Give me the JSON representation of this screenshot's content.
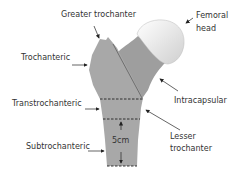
{
  "labels": {
    "greater_trochanter": "Greater  trochanter",
    "femoral_head_1": "Femoral",
    "femoral_head_2": "head",
    "trochanteric": "Trochanteric",
    "intracapsular": "Intracapsular",
    "transtrochanteric": "Transtrochanteric",
    "lesser_trochanter_1": "Lesser",
    "lesser_trochanter_2": "trochanter",
    "subtrochanteric": "Subtrochanteric",
    "measure": "5cm"
  },
  "colors": {
    "bone": "#a6a6a6",
    "neck": "#9c9c9c",
    "head_light": "#ffffff",
    "head_dark": "#d2d2d2",
    "line": "#333333"
  }
}
